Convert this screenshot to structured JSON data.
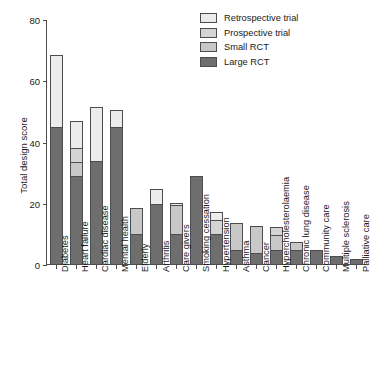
{
  "chart_data": {
    "type": "bar",
    "stacked": true,
    "title": "",
    "xlabel": "",
    "ylabel": "Total design score",
    "ylim": [
      0,
      80
    ],
    "yticks": [
      0,
      20,
      40,
      60,
      80
    ],
    "grid": false,
    "legend_position": "top-right",
    "categories": [
      "Diabetes",
      "Heart failure",
      "Cardiac disease",
      "Mental health",
      "Elderly",
      "Arthritis",
      "Care givers",
      "Smoking cessation",
      "Hypertension",
      "Asthma",
      "Cancer",
      "Hypercholesterolaemia",
      "Chronic lung disease",
      "Community care",
      "Multiple sclerosis",
      "Palliative care"
    ],
    "series": [
      {
        "name": "Large RCT",
        "color": "#6e6e6e",
        "values": [
          45,
          29,
          34,
          45,
          10,
          20,
          10,
          29,
          10,
          5,
          4,
          5,
          5,
          5,
          3,
          2
        ]
      },
      {
        "name": "Small RCT",
        "color": "#c8c8c8",
        "values": [
          0,
          5,
          0,
          0,
          9,
          0,
          10,
          0,
          0,
          9,
          9,
          5,
          3,
          0,
          0,
          0
        ]
      },
      {
        "name": "Prospective trial",
        "color": "#d4d4d4",
        "values": [
          0,
          5,
          0,
          0,
          0,
          0,
          0,
          0,
          5,
          0,
          0,
          3,
          0,
          0,
          0,
          0
        ]
      },
      {
        "name": "Retrospective trial",
        "color": "#ececec",
        "values": [
          24,
          9,
          18,
          6,
          0,
          5,
          1,
          0,
          3,
          0,
          0,
          0,
          0,
          0,
          0,
          0
        ]
      }
    ],
    "totals": [
      69,
      48,
      52,
      51,
      19,
      25,
      21,
      29,
      18,
      14,
      13,
      13,
      8,
      5,
      3,
      2
    ]
  },
  "legend": {
    "entries": [
      {
        "label": "Retrospective trial",
        "color": "#ececec"
      },
      {
        "label": "Prospective trial",
        "color": "#d4d4d4"
      },
      {
        "label": "Small RCT",
        "color": "#c8c8c8"
      },
      {
        "label": "Large RCT",
        "color": "#6e6e6e"
      }
    ]
  }
}
